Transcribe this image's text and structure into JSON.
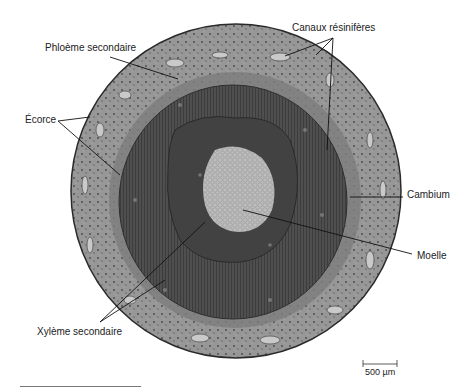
{
  "figure": {
    "labels": {
      "resin_canals": "Canaux résinifères",
      "secondary_phloem": "Phloème secondaire",
      "cortex": "Écorce",
      "cambium": "Cambium",
      "pith": "Moelle",
      "secondary_xylem": "Xylème secondaire"
    },
    "scale_bar": {
      "label": "500 µm"
    },
    "colors": {
      "cortex": "#9a9a9a",
      "cortex_outline": "#2a2a2a",
      "xylem": "#4e4e4e",
      "inner_xylem": "#3e3e3e",
      "pith": "#b9b9b9",
      "canal": "#c8c8c8",
      "leader_line": "#111111"
    }
  }
}
